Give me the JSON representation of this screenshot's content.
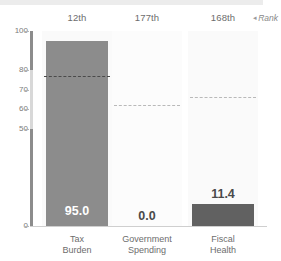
{
  "chart_data": {
    "type": "bar",
    "title": "",
    "subtitle": "",
    "xlabel": "",
    "ylabel": "",
    "ylim": [
      0,
      100
    ],
    "yticks": [
      0,
      50,
      60,
      70,
      80,
      100
    ],
    "ytick_labels": [
      "0",
      "50",
      "60",
      "70",
      "80",
      "100"
    ],
    "grid": false,
    "legend_position": "top-right",
    "categories": [
      "Tax Burden",
      "Government Spending",
      "Fiscal Health"
    ],
    "category_lines": [
      [
        "Tax",
        "Burden"
      ],
      [
        "Government",
        "Spending"
      ],
      [
        "Fiscal",
        "Health"
      ]
    ],
    "values": [
      95.0,
      0.0,
      11.4
    ],
    "value_labels": [
      "95.0",
      "0.0",
      "11.4"
    ],
    "ranks": [
      "12th",
      "177th",
      "168th"
    ],
    "series": [
      {
        "name": "Score",
        "values": [
          95.0,
          0.0,
          11.4
        ]
      },
      {
        "name": "World Average",
        "values": [
          77.0,
          62.0,
          66.0
        ]
      }
    ],
    "reference_lines": [
      77.0,
      62.0,
      66.0
    ],
    "annotations": {
      "rank_legend": "Rank",
      "rank_legend_caret": "◂"
    },
    "colors": {
      "bar_high": "#8c8c8c",
      "bar_low": "#616161",
      "panel_background": "#fafafa",
      "reference_line": "#4a4a4a",
      "reference_line_muted": "#b9b9b9",
      "axis_accent_dark": "#8c8c8c",
      "axis_accent_light": "#d8d8d8",
      "tick_text": "#7a7a7a",
      "rank_text": "#6d6d6d",
      "category_text": "#6d6d6d",
      "value_text_on_bar": "#ffffff",
      "value_text_off_bar": "#4a4a4a",
      "top_band": "#ececec"
    }
  },
  "yaxis": {
    "ticks": [
      {
        "label": "100",
        "value": 100
      },
      {
        "label": "80",
        "value": 80
      },
      {
        "label": "70",
        "value": 70
      },
      {
        "label": "60",
        "value": 60
      },
      {
        "label": "50",
        "value": 50
      },
      {
        "label": "0",
        "value": 0
      }
    ]
  },
  "columns": [
    {
      "rank": "12th",
      "value_label": "95.0",
      "value": 95.0,
      "reference": 77.0,
      "label_line1": "Tax",
      "label_line2": "Burden"
    },
    {
      "rank": "177th",
      "value_label": "0.0",
      "value": 0.0,
      "reference": 62.0,
      "label_line1": "Government",
      "label_line2": "Spending"
    },
    {
      "rank": "168th",
      "value_label": "11.4",
      "value": 11.4,
      "reference": 66.0,
      "label_line1": "Fiscal",
      "label_line2": "Health"
    }
  ],
  "legend": {
    "caret": "◂",
    "label": "Rank"
  }
}
